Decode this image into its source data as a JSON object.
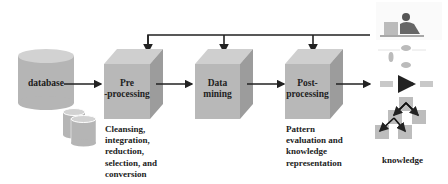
{
  "diagram": {
    "nodes": {
      "database": {
        "label": "database"
      },
      "preprocessing": {
        "label_line1": "Pre",
        "label_line2": "-processing"
      },
      "datamining": {
        "label_line1": "Data",
        "label_line2": "mining"
      },
      "postprocessing": {
        "label_line1": "Post-",
        "label_line2": "processing"
      },
      "knowledge": {
        "label": "knowledge"
      }
    },
    "descriptions": {
      "preprocessing": [
        "Cleansing,",
        "integration,",
        "reduction,",
        "selection, and",
        "conversion"
      ],
      "postprocessing": [
        "Pattern",
        "evaluation and",
        "knowledge",
        "representation"
      ]
    },
    "colors": {
      "cube_front": "#b8b8b8",
      "cube_top": "#cfcfcf",
      "cube_side": "#9c9c9c",
      "cylinder": "#b5b5b5",
      "cylinder_top": "#d2d2d2",
      "arrow": "#222222"
    }
  }
}
